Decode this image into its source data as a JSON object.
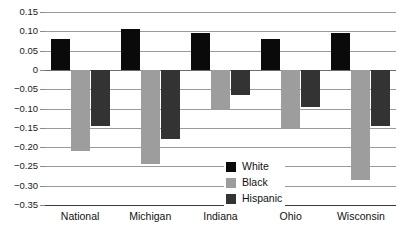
{
  "chart_data": {
    "type": "bar",
    "title": "",
    "subtitle": "",
    "xlabel": "",
    "ylabel": "",
    "categories": [
      "National",
      "Michigan",
      "Indiana",
      "Ohio",
      "Wisconsin"
    ],
    "series": [
      {
        "name": "White",
        "color": "#0a0a0a",
        "values": [
          0.08,
          0.105,
          0.095,
          0.08,
          0.095
        ]
      },
      {
        "name": "Black",
        "color": "#9d9d9d",
        "values": [
          -0.21,
          -0.245,
          -0.105,
          -0.15,
          -0.285
        ]
      },
      {
        "name": "Hispanic",
        "color": "#333333",
        "values": [
          -0.145,
          -0.18,
          -0.065,
          -0.095,
          -0.145
        ]
      }
    ],
    "ylim": [
      -0.35,
      0.15
    ],
    "ytick_values": [
      0.15,
      0.1,
      0.05,
      0,
      -0.05,
      -0.1,
      -0.15,
      -0.2,
      -0.25,
      -0.3,
      -0.35
    ],
    "ytick_labels": [
      "0.15",
      "0.10",
      "0.05",
      "0",
      "−0.05",
      "−0.10",
      "−0.15",
      "−0.20",
      "−0.25",
      "−0.30",
      "−0.35"
    ],
    "grid": true,
    "grid_axis": "y",
    "legend_position": "center",
    "legend_entries": [
      "White",
      "Black",
      "Hispanic"
    ],
    "bar_orientation": "vertical",
    "grouped": true
  }
}
